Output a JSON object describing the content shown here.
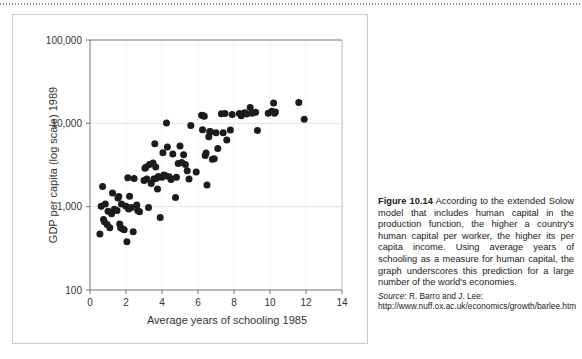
{
  "top_rule": {
    "style": "dotted"
  },
  "figure": {
    "panel_border_color": "#c9c9c9",
    "background": "#ffffff"
  },
  "caption": {
    "figure_number": "Figure 10.14",
    "body": " According to the extended Solow model that includes human capital in the production function, the higher a country's human capital per worker, the higher its per capita income. Using average years of schooling as a measure for human capital, the graph underscores this prediction for a large number of the world's economies.",
    "source_label": "Source",
    "source_text": ": R. Barro and J. Lee: http://www.nuff.ox.ac.uk/economics/growth/barlee.htm"
  },
  "chart_data": {
    "type": "scatter",
    "title": "",
    "xlabel": "Average years of schooling 1985",
    "ylabel": "GDP per capita (log scale) 1989",
    "xlim": [
      0,
      14
    ],
    "ylim": [
      100,
      100000
    ],
    "yscale": "log",
    "grid": true,
    "legend": null,
    "xticks": [
      0,
      2,
      4,
      6,
      8,
      10,
      12,
      14
    ],
    "xtick_labels": [
      "0",
      "2",
      "4",
      "6",
      "8",
      "10",
      "12",
      "14"
    ],
    "yticks": [
      100,
      1000,
      10000,
      100000
    ],
    "ytick_labels": [
      "100",
      "1,000",
      "10,000",
      "100,000"
    ],
    "marker": {
      "shape": "circle",
      "color": "#1c1c1c",
      "size": 3.5
    },
    "points": [
      [
        0.55,
        470
      ],
      [
        0.62,
        1010
      ],
      [
        0.7,
        1750
      ],
      [
        0.75,
        700
      ],
      [
        0.8,
        660
      ],
      [
        0.85,
        1080
      ],
      [
        0.95,
        610
      ],
      [
        1.0,
        880
      ],
      [
        1.1,
        560
      ],
      [
        1.2,
        820
      ],
      [
        1.25,
        1460
      ],
      [
        1.35,
        930
      ],
      [
        1.5,
        900
      ],
      [
        1.55,
        1270
      ],
      [
        1.6,
        1320
      ],
      [
        1.65,
        620
      ],
      [
        1.7,
        560
      ],
      [
        1.75,
        1080
      ],
      [
        1.8,
        545
      ],
      [
        1.9,
        530
      ],
      [
        2.0,
        1010
      ],
      [
        2.05,
        380
      ],
      [
        2.1,
        2220
      ],
      [
        2.15,
        940
      ],
      [
        2.2,
        1330
      ],
      [
        2.3,
        980
      ],
      [
        2.4,
        500
      ],
      [
        2.45,
        2180
      ],
      [
        2.6,
        1050
      ],
      [
        2.65,
        900
      ],
      [
        2.75,
        870
      ],
      [
        3.0,
        2060
      ],
      [
        3.05,
        2900
      ],
      [
        3.1,
        2980
      ],
      [
        3.15,
        2150
      ],
      [
        3.25,
        980
      ],
      [
        3.3,
        3200
      ],
      [
        3.4,
        1900
      ],
      [
        3.5,
        3350
      ],
      [
        3.55,
        2150
      ],
      [
        3.6,
        5700
      ],
      [
        3.65,
        3000
      ],
      [
        3.7,
        2200
      ],
      [
        3.75,
        1630
      ],
      [
        3.8,
        2300
      ],
      [
        3.9,
        740
      ],
      [
        4.0,
        2250
      ],
      [
        4.05,
        4450
      ],
      [
        4.1,
        2400
      ],
      [
        4.2,
        2350
      ],
      [
        4.25,
        10100
      ],
      [
        4.3,
        5200
      ],
      [
        4.4,
        2280
      ],
      [
        4.5,
        2120
      ],
      [
        4.6,
        4300
      ],
      [
        4.75,
        1290
      ],
      [
        4.8,
        2250
      ],
      [
        4.9,
        3300
      ],
      [
        5.0,
        5350
      ],
      [
        5.1,
        3400
      ],
      [
        5.2,
        4200
      ],
      [
        5.3,
        3200
      ],
      [
        5.4,
        2700
      ],
      [
        5.5,
        2150
      ],
      [
        5.6,
        9400
      ],
      [
        5.9,
        2600
      ],
      [
        6.2,
        12500
      ],
      [
        6.25,
        8400
      ],
      [
        6.3,
        12300
      ],
      [
        6.35,
        12200
      ],
      [
        6.4,
        4100
      ],
      [
        6.45,
        4400
      ],
      [
        6.5,
        1820
      ],
      [
        6.6,
        6900
      ],
      [
        6.65,
        8000
      ],
      [
        6.7,
        7900
      ],
      [
        6.8,
        3700
      ],
      [
        6.9,
        3750
      ],
      [
        7.0,
        7700
      ],
      [
        7.1,
        5000
      ],
      [
        7.3,
        13000
      ],
      [
        7.4,
        7700
      ],
      [
        7.5,
        13100
      ],
      [
        7.6,
        6300
      ],
      [
        7.8,
        8300
      ],
      [
        7.9,
        12800
      ],
      [
        8.3,
        13100
      ],
      [
        8.4,
        12300
      ],
      [
        8.5,
        13000
      ],
      [
        8.6,
        13400
      ],
      [
        8.7,
        12900
      ],
      [
        8.9,
        15500
      ],
      [
        9.0,
        13200
      ],
      [
        9.2,
        13600
      ],
      [
        9.3,
        8200
      ],
      [
        9.9,
        13200
      ],
      [
        10.1,
        14000
      ],
      [
        10.2,
        17500
      ],
      [
        10.25,
        13200
      ],
      [
        10.3,
        13700
      ],
      [
        11.6,
        17800
      ],
      [
        11.9,
        11200
      ]
    ]
  }
}
